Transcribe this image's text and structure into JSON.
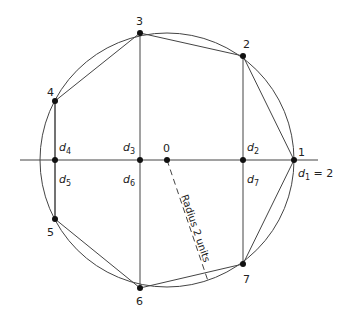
{
  "diagram": {
    "circle": {
      "cx": 167,
      "cy": 160,
      "r": 127
    },
    "center": {
      "label": "0",
      "x": 167,
      "y": 160
    },
    "axis": {
      "x1": 20,
      "x2": 318,
      "y": 160
    },
    "points": [
      {
        "id": "1",
        "label": "1",
        "x": 294,
        "y": 160
      },
      {
        "id": "2",
        "label": "2",
        "x": 243,
        "y": 56
      },
      {
        "id": "3",
        "label": "3",
        "x": 140,
        "y": 33
      },
      {
        "id": "4",
        "label": "4",
        "x": 55,
        "y": 101
      },
      {
        "id": "5",
        "label": "5",
        "x": 55,
        "y": 219
      },
      {
        "id": "6",
        "label": "6",
        "x": 140,
        "y": 288
      },
      {
        "id": "7",
        "label": "7",
        "x": 243,
        "y": 264
      }
    ],
    "distances": {
      "d1": {
        "base": "d",
        "sub": "1",
        "suffix": " = 2"
      },
      "d2": {
        "base": "d",
        "sub": "2"
      },
      "d3": {
        "base": "d",
        "sub": "3"
      },
      "d4": {
        "base": "d",
        "sub": "4"
      },
      "d5": {
        "base": "d",
        "sub": "5"
      },
      "d6": {
        "base": "d",
        "sub": "6"
      },
      "d7": {
        "base": "d",
        "sub": "7"
      }
    },
    "radius_label": "Radius 2 units",
    "colors": {
      "line": "#444444",
      "point": "#111111",
      "text": "#222222"
    }
  }
}
